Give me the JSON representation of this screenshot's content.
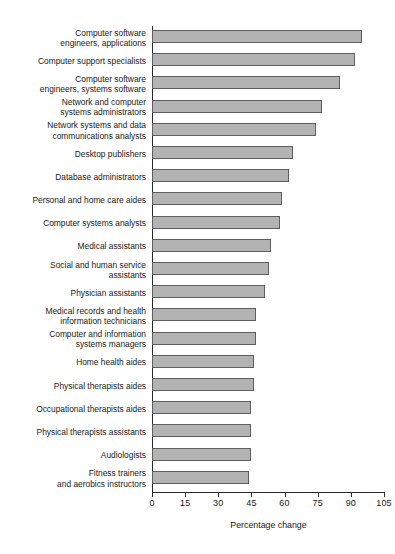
{
  "chart_data": {
    "type": "bar",
    "orientation": "horizontal",
    "title": "",
    "xlabel": "Percentage change",
    "ylabel": "",
    "xlim": [
      0,
      105
    ],
    "xticks": [
      0,
      15,
      30,
      45,
      60,
      75,
      90,
      105
    ],
    "grid": false,
    "legend": null,
    "categories": [
      "Computer software\nengineers, applications",
      "Computer support specialists",
      "Computer software\nengineers, systems software",
      "Network and computer\nsystems administrators",
      "Network systems and data\ncommunications analysts",
      "Desktop publishers",
      "Database administrators",
      "Personal and home care aides",
      "Computer systems analysts",
      "Medical assistants",
      "Social and human service\nassistants",
      "Physician assistants",
      "Medical records and health\ninformation technicians",
      "Computer and information\nsystems managers",
      "Home health aides",
      "Physical therapists aides",
      "Occupational therapists aides",
      "Physical therapists assistants",
      "Audiologists",
      "Fitness trainers\nand aerobics instructors"
    ],
    "values": [
      95,
      92,
      85,
      77,
      74,
      64,
      62,
      59,
      58,
      54,
      53,
      51,
      47,
      47,
      46,
      46,
      45,
      45,
      45,
      44
    ],
    "bar_color": "#b3b3b3",
    "bar_border_color": "#5e5e5e",
    "axis_color": "#2a2a2a"
  }
}
